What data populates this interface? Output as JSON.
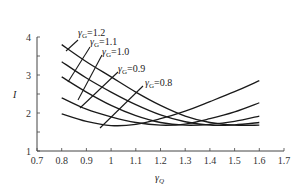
{
  "chart_data": {
    "type": "line",
    "title": "",
    "xlabel": "γQ",
    "ylabel": "I",
    "xlim": [
      0.7,
      1.7
    ],
    "ylim": [
      1,
      4
    ],
    "x_ticks": [
      "0.7",
      "0.8",
      "0.9",
      "1",
      "1.1",
      "1.2",
      "1.3",
      "1.4",
      "1.5",
      "1.6",
      "1.7"
    ],
    "y_ticks": [
      "1",
      "2",
      "3",
      "4"
    ],
    "grid": false,
    "x": [
      0.8,
      0.9,
      1.0,
      1.1,
      1.2,
      1.3,
      1.4,
      1.5,
      1.6
    ],
    "series": [
      {
        "name": "γG=1.2",
        "label_main": "γ",
        "label_sub": "G",
        "label_val": "=1.2",
        "values": [
          3.8,
          3.35,
          2.95,
          2.55,
          2.2,
          1.92,
          1.75,
          1.68,
          1.68
        ]
      },
      {
        "name": "γG=1.1",
        "label_main": "γ",
        "label_sub": "G",
        "label_val": "=1.1",
        "values": [
          3.35,
          2.92,
          2.55,
          2.22,
          1.95,
          1.77,
          1.68,
          1.69,
          1.75
        ]
      },
      {
        "name": "γG=1.0",
        "label_main": "γ",
        "label_sub": "G",
        "label_val": "=1.0",
        "values": [
          2.95,
          2.55,
          2.2,
          1.93,
          1.75,
          1.68,
          1.7,
          1.78,
          1.92
        ]
      },
      {
        "name": "γG=0.9",
        "label_main": "γ",
        "label_sub": "G",
        "label_val": "=0.9",
        "values": [
          2.4,
          2.1,
          1.9,
          1.75,
          1.68,
          1.71,
          1.85,
          2.03,
          2.27
        ]
      },
      {
        "name": "γG=0.8",
        "label_main": "γ",
        "label_sub": "G",
        "label_val": "=0.8",
        "values": [
          1.98,
          1.78,
          1.67,
          1.7,
          1.85,
          2.05,
          2.3,
          2.56,
          2.85
        ]
      }
    ],
    "annotations": [
      {
        "text": "γG=1.2",
        "x": 78,
        "y": 36,
        "leader": [
          78,
          40,
          66,
          51
        ]
      },
      {
        "text": "γG=1.1",
        "x": 90,
        "y": 45,
        "leader": [
          90,
          47,
          68,
          82
        ]
      },
      {
        "text": "γG=1.0",
        "x": 102,
        "y": 55,
        "leader": [
          102,
          55,
          78,
          100
        ]
      },
      {
        "text": "γG=0.9",
        "x": 118,
        "y": 72,
        "leader": [
          118,
          72,
          80,
          108
        ]
      },
      {
        "text": "γG=0.8",
        "x": 145,
        "y": 86,
        "leader": [
          143,
          86,
          100,
          128
        ]
      }
    ],
    "legend": "inline labels"
  },
  "axes": {
    "xlabel_main": "γ",
    "xlabel_sub": "Q",
    "ylabel": "I"
  }
}
